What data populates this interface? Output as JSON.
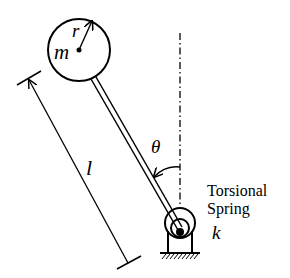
{
  "diagram": {
    "labels": {
      "mass": "m",
      "radius": "r",
      "length": "l",
      "angle": "θ",
      "spring_line1": "Torsional",
      "spring_line2": "Spring",
      "stiffness": "k"
    },
    "elements": [
      {
        "id": "mass-disk",
        "type": "circle",
        "label": "m"
      },
      {
        "id": "radius-arrow",
        "type": "arrow",
        "label": "r"
      },
      {
        "id": "rod",
        "type": "double-line"
      },
      {
        "id": "length-dimension",
        "type": "dimension-line",
        "label": "l"
      },
      {
        "id": "vertical-reference",
        "type": "dash-dot-line"
      },
      {
        "id": "angle-arc",
        "type": "arc-arrow",
        "label": "θ"
      },
      {
        "id": "torsional-spring",
        "type": "spring",
        "label": "k"
      },
      {
        "id": "ground",
        "type": "hatched-support"
      }
    ],
    "colors": {
      "stroke": "#000000",
      "background": "#ffffff"
    }
  }
}
